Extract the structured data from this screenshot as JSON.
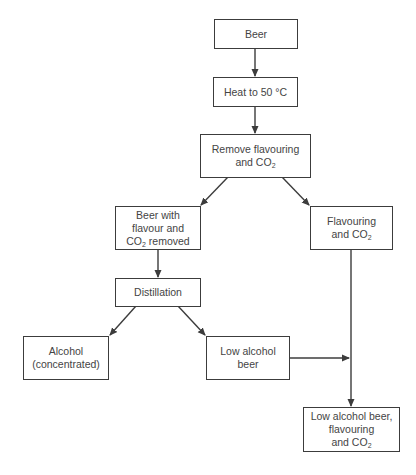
{
  "diagram": {
    "type": "flowchart",
    "nodes": {
      "beer": {
        "label": "Beer"
      },
      "heat": {
        "label": "Heat to 50 °C"
      },
      "remove": {
        "line1": "Remove flavouring",
        "line2_pre": "and CO",
        "line2_sub": "2"
      },
      "beer_removed": {
        "line1": "Beer with",
        "line2": "flavour and",
        "line3_pre": "CO",
        "line3_sub": "2",
        "line3_post": " removed"
      },
      "flavouring": {
        "line1": "Flavouring",
        "line2_pre": "and CO",
        "line2_sub": "2"
      },
      "distillation": {
        "label": "Distillation"
      },
      "alcohol": {
        "line1": "Alcohol",
        "line2": "(concentrated)"
      },
      "low_alcohol_beer": {
        "line1": "Low alcohol",
        "line2": "beer"
      },
      "final": {
        "line1": "Low alcohol beer,",
        "line2": "flavouring",
        "line3_pre": "and CO",
        "line3_sub": "2"
      }
    },
    "edges": [
      {
        "from": "Beer",
        "to": "Heat to 50 °C"
      },
      {
        "from": "Heat to 50 °C",
        "to": "Remove flavouring and CO2"
      },
      {
        "from": "Remove flavouring and CO2",
        "to": "Beer with flavour and CO2 removed"
      },
      {
        "from": "Remove flavouring and CO2",
        "to": "Flavouring and CO2"
      },
      {
        "from": "Beer with flavour and CO2 removed",
        "to": "Distillation"
      },
      {
        "from": "Distillation",
        "to": "Alcohol (concentrated)"
      },
      {
        "from": "Distillation",
        "to": "Low alcohol beer"
      },
      {
        "from": "Flavouring and CO2",
        "to": "Low alcohol beer, flavouring and CO2"
      },
      {
        "from": "Low alcohol beer",
        "to": "Low alcohol beer, flavouring and CO2"
      }
    ],
    "colors": {
      "line": "#3c3c3c",
      "text": "#444444",
      "background": "#ffffff"
    }
  }
}
